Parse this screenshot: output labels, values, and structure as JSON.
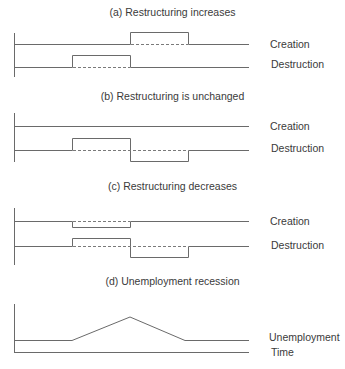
{
  "panels": [
    {
      "id": "a",
      "title": "(a) Restructuring increases",
      "series": [
        {
          "name": "Creation",
          "description": "baseline, rises above baseline during second interval (t2-t3)"
        },
        {
          "name": "Destruction",
          "description": "baseline, rises above baseline during first interval (t1-t2)"
        }
      ]
    },
    {
      "id": "b",
      "title": "(b) Restructuring is unchanged",
      "series": [
        {
          "name": "Creation",
          "description": "flat baseline throughout"
        },
        {
          "name": "Destruction",
          "description": "rises during first interval, falls below baseline during second interval"
        }
      ]
    },
    {
      "id": "c",
      "title": "(c) Restructuring decreases",
      "series": [
        {
          "name": "Creation",
          "description": "dips below baseline during first interval"
        },
        {
          "name": "Destruction",
          "description": "rises during first interval, falls below baseline during second interval"
        }
      ]
    },
    {
      "id": "d",
      "title": "(d) Unemployment recession",
      "series": [
        {
          "name": "Unemployment",
          "description": "flat, rises linearly to peak at t2, falls back to baseline by t3"
        },
        {
          "name": "Time",
          "description": "horizontal time axis"
        }
      ]
    }
  ],
  "labels": {
    "creation": "Creation",
    "destruction": "Destruction",
    "unemployment": "Unemployment",
    "time": "Time"
  },
  "titles": {
    "a": "(a) Restructuring increases",
    "b": "(b) Restructuring is unchanged",
    "c": "(c) Restructuring decreases",
    "d": "(d) Unemployment recession"
  }
}
